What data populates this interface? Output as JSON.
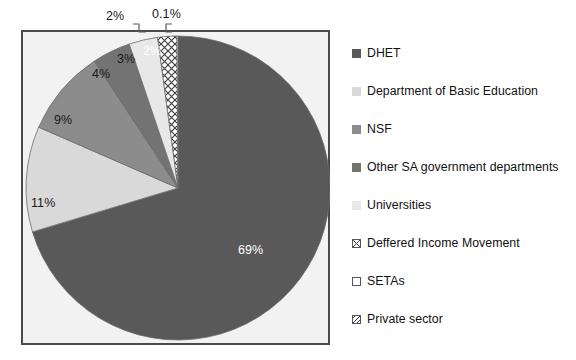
{
  "chart_data": {
    "type": "pie",
    "title": "",
    "labels": [
      "DHET",
      "Department of Basic Education",
      "NSF",
      "Other SA government departments",
      "Universities",
      "Deffered Income Movement",
      "SETAs",
      "Private sector"
    ],
    "values": [
      69,
      11,
      9,
      4,
      3,
      2,
      0.1,
      0
    ],
    "data_labels": [
      "69%",
      "11%",
      "9%",
      "4%",
      "3%",
      "2%",
      "0.1%",
      ""
    ],
    "slice_colors": [
      "#595959",
      "#d9d9d9",
      "#8c8c8c",
      "#737373",
      "#e8e8e8",
      "#ffffff",
      "#ffffff",
      "#ffffff"
    ],
    "slice_patterns": [
      "solid",
      "solid",
      "solid",
      "solid",
      "solid",
      "crosshatch",
      "none",
      "diagonal"
    ],
    "label_text_colors": [
      "#ffffff",
      "#1a1a1a",
      "#1a1a1a",
      "#1a1a1a",
      "#1a1a1a",
      "#ffffff",
      "#1a1a1a",
      "#1a1a1a"
    ],
    "start_angle_deg": 0,
    "direction": "clockwise",
    "legend_position": "right",
    "grid": false,
    "plot_background": "#f2f2f2",
    "plot_border": "#4a4a4a"
  },
  "plot": {
    "inner_labels": [
      {
        "text": "69%",
        "x": 238,
        "y": 243,
        "color": "#ffffff"
      },
      {
        "text": "11%",
        "x": 31,
        "y": 196,
        "color": "#1a1a1a"
      },
      {
        "text": "9%",
        "x": 54,
        "y": 113,
        "color": "#1a1a1a"
      },
      {
        "text": "4%",
        "x": 92,
        "y": 67,
        "color": "#1a1a1a"
      },
      {
        "text": "3%",
        "x": 117,
        "y": 52,
        "color": "#1a1a1a"
      },
      {
        "text": "2%",
        "x": 143,
        "y": 44,
        "color": "#ffffff"
      }
    ],
    "callouts": [
      {
        "name": "deferred-income-callout",
        "text": "2%"
      },
      {
        "name": "setas-callout",
        "text": "0.1%"
      }
    ]
  },
  "legend": {
    "items": [
      {
        "label": "DHET",
        "swatch": "solid",
        "color": "#595959"
      },
      {
        "label": "Department of Basic Education",
        "swatch": "solid",
        "color": "#d9d9d9"
      },
      {
        "label": "NSF",
        "swatch": "solid",
        "color": "#8c8c8c"
      },
      {
        "label": "Other SA government departments",
        "swatch": "solid",
        "color": "#737373"
      },
      {
        "label": "Universities",
        "swatch": "solid",
        "color": "#e8e8e8"
      },
      {
        "label": "Deffered Income Movement",
        "swatch": "crosshatch",
        "color": "#ffffff"
      },
      {
        "label": "SETAs",
        "swatch": "empty",
        "color": "#ffffff"
      },
      {
        "label": "Private sector",
        "swatch": "diagonal",
        "color": "#ffffff"
      }
    ]
  }
}
